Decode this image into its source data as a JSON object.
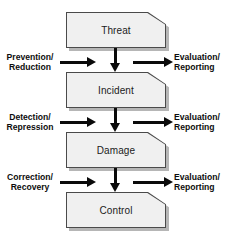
{
  "diagram": {
    "colors": {
      "box_fill": "#f0f0f0",
      "box_border": "#4a4a4a",
      "box_shadow": "#b6b6b6",
      "arrow": "#0a0a0a",
      "text": "#1b1b1b",
      "background": "#ffffff"
    },
    "stages": [
      {
        "id": "threat",
        "label": "Threat"
      },
      {
        "id": "incident",
        "label": "Incident"
      },
      {
        "id": "damage",
        "label": "Damage"
      },
      {
        "id": "control",
        "label": "Control"
      }
    ],
    "rows": [
      {
        "id": "row-1",
        "left_label_line1": "Prevention/",
        "left_label_line2": "Reduction",
        "right_label_line1": "Evaluation/",
        "right_label_line2": "Reporting",
        "left_arrow": "arrow-right-icon",
        "down_arrow": "arrow-down-icon",
        "right_arrow": "arrow-right-icon"
      },
      {
        "id": "row-2",
        "left_label_line1": "Detection/",
        "left_label_line2": "Repression",
        "right_label_line1": "Evaluation/",
        "right_label_line2": "Reporting",
        "left_arrow": "arrow-right-icon",
        "down_arrow": "arrow-down-icon",
        "right_arrow": "arrow-right-icon"
      },
      {
        "id": "row-3",
        "left_label_line1": "Correction/",
        "left_label_line2": "Recovery",
        "right_label_line1": "Evaluation/",
        "right_label_line2": "Reporting",
        "left_arrow": "arrow-right-icon",
        "down_arrow": "arrow-down-icon",
        "right_arrow": "arrow-right-icon"
      }
    ]
  }
}
